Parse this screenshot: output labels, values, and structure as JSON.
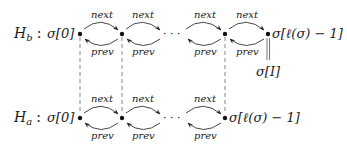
{
  "diagram": {
    "rows": [
      {
        "id": "Hb",
        "label_base": "H",
        "label_sub": "b",
        "first_node_label": "σ[0]",
        "last_node_label": "σ[ℓ(σ) − 1]",
        "extra_label": "σ[I]"
      },
      {
        "id": "Ha",
        "label_base": "H",
        "label_sub": "a",
        "first_node_label": "σ[0]",
        "last_node_label": "σ[ℓ(σ) − 1]"
      }
    ],
    "edge_labels": {
      "next": "next",
      "prev": "prev"
    },
    "ellipsis": "· · ·",
    "colon": ":"
  }
}
